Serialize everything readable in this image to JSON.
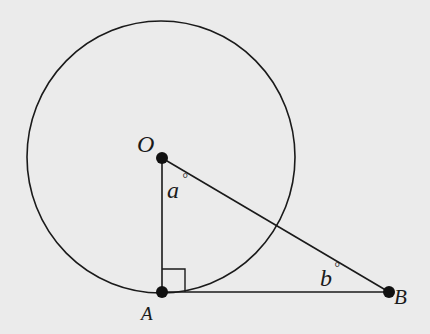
{
  "figure": {
    "background": "#ebebeb",
    "stroke_color": "#1a1a1a",
    "circle": {
      "center_label": "O",
      "cx": 161,
      "cy": 157,
      "rx": 134,
      "ry": 136
    },
    "points": {
      "O": {
        "label": "O",
        "x": 162,
        "y": 158
      },
      "A": {
        "label": "A",
        "x": 162,
        "y": 292
      },
      "B": {
        "label": "B",
        "x": 389,
        "y": 292
      }
    },
    "segments": [
      "OA",
      "AB",
      "OB"
    ],
    "right_angle_at": "A",
    "angles": {
      "a": {
        "label": "a",
        "unit": "°",
        "at": "O"
      },
      "b": {
        "label": "b",
        "unit": "°",
        "at": "B"
      }
    }
  }
}
